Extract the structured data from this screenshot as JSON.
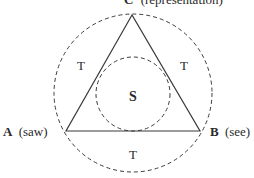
{
  "diagram": {
    "type": "semiotic-triangle",
    "apex_label": {
      "letter": "C",
      "text": "(representation)"
    },
    "left_label": {
      "letter": "A",
      "text": "(saw)"
    },
    "right_label": {
      "letter": "B",
      "text": "(see)"
    },
    "center_label": "S",
    "region_labels": {
      "top_left": "T",
      "top_right": "T",
      "bottom": "T"
    },
    "colors": {
      "stroke": "#3a3a3a",
      "text": "#2a2a2a",
      "background": "#ffffff"
    }
  }
}
